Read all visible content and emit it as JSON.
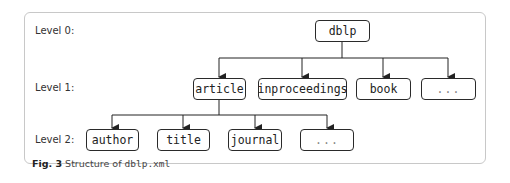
{
  "levels": [
    {
      "label": "Level 0:"
    },
    {
      "label": "Level 1:"
    },
    {
      "label": "Level 2:"
    }
  ],
  "nodes": {
    "root": "dblp",
    "level1": [
      "article",
      "inproceedings",
      "book",
      "..."
    ],
    "level2": [
      "author",
      "title",
      "journal",
      "..."
    ]
  },
  "caption": {
    "fig_label": "Fig. 3",
    "text": "Structure of",
    "code": "dblp.xml"
  },
  "colors": {
    "line": "#222222",
    "frame": "#c8c8c8",
    "ellipsis_text": "#888888"
  }
}
